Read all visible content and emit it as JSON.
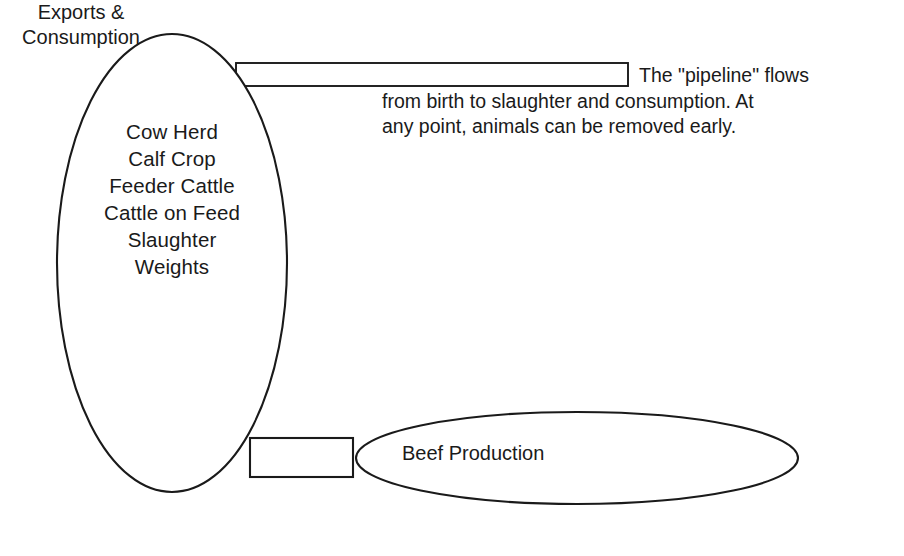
{
  "diagram": {
    "background_color": "#ffffff",
    "line_color": "#1a1a1a",
    "shapes": {
      "main_ellipse": {
        "name": "production-stages-ellipse"
      },
      "top_pipeline_bar": {
        "name": "pipeline-bar"
      },
      "bottom_connector_box": {
        "name": "connector-box"
      },
      "output_ellipse": {
        "name": "output-ellipse"
      }
    },
    "stage_list": {
      "lines": [
        "Cow Herd",
        "Calf Crop",
        "Feeder Cattle",
        "Cattle on Feed",
        "Slaughter",
        "Weights"
      ]
    },
    "caption": {
      "lines": [
        "The \"pipeline\" flows",
        "from birth to slaughter and consumption. At",
        "any point, animals can be removed early."
      ],
      "full_text": "The \"pipeline\" flows from birth to slaughter and consumption. At any point, animals can be removed early."
    },
    "output_labels": {
      "beef_production": "Beef Production",
      "exports_consumption_lines": [
        "Exports &",
        "Consumption"
      ],
      "exports_consumption": "Exports & Consumption"
    }
  }
}
